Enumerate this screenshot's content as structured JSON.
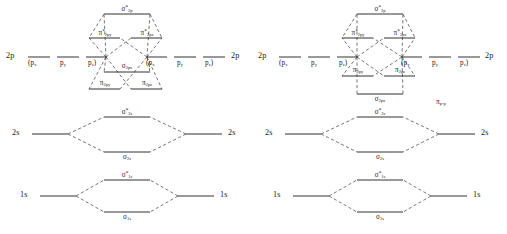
{
  "figure": {
    "background_color": "#ffffff",
    "line_color": "#1c1c1c",
    "dash_color": "#2b2b2b"
  },
  "symbols": {
    "sigma": "σ",
    "pi": "π",
    "star": "*"
  },
  "diagrams": [
    {
      "id": "left",
      "name": "mo-diagram-sigma2p-below-pi2p",
      "ordering_note": "sigma 2p lies above pi 2p bonding levels",
      "atomic_levels": {
        "p_shell_label": "2p",
        "p_components_left": [
          "(p",
          "p",
          "p",
          ")"
        ],
        "p_open_paren": "(",
        "p_close_paren": ")",
        "p_sub_x": "x",
        "p_sub_y": "y",
        "p_sub_z": "z",
        "s_shell_label": "2s",
        "core_shell_label": "1s"
      },
      "molecular_levels": [
        {
          "name": "sigma-star-2p",
          "base": "σ",
          "star": "*",
          "sub": "2p",
          "kind": "antibonding"
        },
        {
          "name": "pi-star-2p-y",
          "base": "π",
          "star": "*",
          "sub": "2p",
          "sub2": "y",
          "kind": "antibonding"
        },
        {
          "name": "pi-star-2p-z",
          "base": "π",
          "star": "*",
          "sub": "2p",
          "sub2": "z",
          "kind": "antibonding"
        },
        {
          "name": "sigma-2p",
          "base": "σ",
          "star": "",
          "sub": "2p",
          "sub2": "x",
          "kind": "bonding"
        },
        {
          "name": "pi-2p-y",
          "base": "π",
          "star": "",
          "sub": "2p",
          "sub2": "y",
          "kind": "bonding"
        },
        {
          "name": "pi-2p-z",
          "base": "π",
          "star": "",
          "sub": "2p",
          "sub2": "z",
          "kind": "bonding"
        },
        {
          "name": "sigma-star-2s",
          "base": "σ",
          "star": "*",
          "sub": "2s",
          "kind": "antibonding"
        },
        {
          "name": "sigma-2s",
          "base": "σ",
          "star": "",
          "sub": "2s",
          "kind": "bonding"
        },
        {
          "name": "sigma-star-1s",
          "base": "σ",
          "star": "*",
          "sub": "1s",
          "kind": "antibonding"
        },
        {
          "name": "sigma-1s",
          "base": "σ",
          "star": "",
          "sub": "1s",
          "kind": "bonding"
        }
      ],
      "annotation": ""
    },
    {
      "id": "right",
      "name": "mo-diagram-pi2p-below-sigma2p",
      "ordering_note": "pi 2p bonding levels lie above sigma 2p",
      "atomic_levels": {
        "p_shell_label": "2p",
        "p_open_paren": "(",
        "p_close_paren": ")",
        "p_sub_x": "x",
        "p_sub_y": "y",
        "p_sub_z": "z",
        "s_shell_label": "2s",
        "core_shell_label": "1s"
      },
      "molecular_levels": [
        {
          "name": "sigma-star-2p",
          "base": "σ",
          "star": "*",
          "sub": "2p",
          "kind": "antibonding"
        },
        {
          "name": "pi-star-2p-y",
          "base": "π",
          "star": "*",
          "sub": "2p",
          "sub2": "y",
          "kind": "antibonding"
        },
        {
          "name": "pi-star-2p-z",
          "base": "π",
          "star": "*",
          "sub": "2p",
          "sub2": "z",
          "kind": "antibonding"
        },
        {
          "name": "pi-2p-y",
          "base": "π",
          "star": "",
          "sub": "2p",
          "sub2": "y",
          "kind": "bonding"
        },
        {
          "name": "pi-2p-z",
          "base": "π",
          "star": "",
          "sub": "2p",
          "sub2": "z",
          "kind": "bonding"
        },
        {
          "name": "sigma-2p",
          "base": "σ",
          "star": "",
          "sub": "2p",
          "sub2": "x",
          "kind": "bonding"
        },
        {
          "name": "sigma-star-2s",
          "base": "σ",
          "star": "*",
          "sub": "2s",
          "kind": "antibonding"
        },
        {
          "name": "sigma-2s",
          "base": "σ",
          "star": "",
          "sub": "2s",
          "kind": "bonding"
        },
        {
          "name": "sigma-star-1s",
          "base": "σ",
          "star": "*",
          "sub": "1s",
          "kind": "antibonding"
        },
        {
          "name": "sigma-1s",
          "base": "σ",
          "star": "",
          "sub": "1s",
          "kind": "bonding"
        }
      ],
      "annotation": "π",
      "annotation_sub": "p-p"
    }
  ],
  "labels": {
    "left": {
      "ao_2p_left": "2p",
      "ao_2p_right": "2p",
      "ao_2s_left": "2s",
      "ao_2s_right": "2s",
      "ao_1s_left": "1s",
      "ao_1s_right": "1s",
      "px_l": "(p",
      "py_l": "p",
      "pz_l": "p",
      "px_r": "(p",
      "py_r": "p",
      "pz_r": "p",
      "sub_x": "x",
      "sub_y": "y",
      "sub_z": "z",
      "close_paren": ")",
      "sigma_star_2p": "σ",
      "sigma_star_2p_sub": "2p",
      "pi_star_2p_a": "π",
      "pi_star_2p_a_sub": "2p",
      "pi_star_2p_b": "π",
      "pi_star_2p_b_sub": "2p",
      "sigma_2p": "σ",
      "sigma_2p_sub": "2p",
      "pi_2p_a": "π",
      "pi_2p_a_sub": "2p",
      "pi_2p_b": "π",
      "pi_2p_b_sub": "2p",
      "sigma_star_2s": "σ",
      "sigma_star_2s_sub": "2s",
      "sigma_2s": "σ",
      "sigma_2s_sub": "2s",
      "sigma_star_1s": "σ",
      "sigma_star_1s_sub": "1s",
      "sigma_1s": "σ",
      "sigma_1s_sub": "1s"
    },
    "right": {
      "ao_2p_left": "2p",
      "ao_2p_right": "2p",
      "ao_2s_left": "2s",
      "ao_2s_right": "2s",
      "ao_1s_left": "1s",
      "ao_1s_right": "1s",
      "px_l": "(p",
      "py_l": "p",
      "pz_l": "p",
      "px_r": "(p",
      "py_r": "p",
      "pz_r": "p",
      "sub_x": "x",
      "sub_y": "y",
      "sub_z": "z",
      "close_paren": ")",
      "sigma_star_2p": "σ",
      "sigma_star_2p_sub": "2p",
      "pi_star_2p_a": "π",
      "pi_star_2p_a_sub": "2p",
      "pi_star_2p_b": "π",
      "pi_star_2p_b_sub": "2p",
      "pi_2p_a": "π",
      "pi_2p_a_sub": "2p",
      "pi_2p_b": "π",
      "pi_2p_b_sub": "2p",
      "sigma_2p": "σ",
      "sigma_2p_sub": "2p",
      "pi_pp": "π",
      "pi_pp_sub": "p-p",
      "sigma_star_2s": "σ",
      "sigma_star_2s_sub": "2s",
      "sigma_2s": "σ",
      "sigma_2s_sub": "2s",
      "sigma_star_1s": "σ",
      "sigma_star_1s_sub": "1s",
      "sigma_1s": "σ",
      "sigma_1s_sub": "1s"
    }
  }
}
